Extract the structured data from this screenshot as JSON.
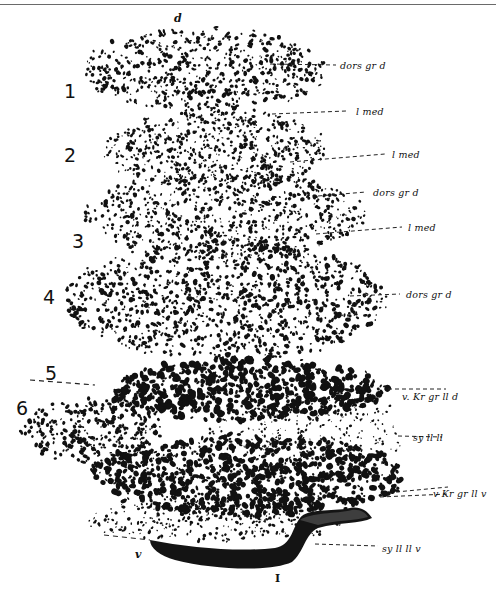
{
  "figure": {
    "ink_color": "#111111",
    "orientation_top": "d",
    "orientation_bottom": "v",
    "roman_numeral": "I",
    "layer_numbers": [
      "1",
      "2",
      "3",
      "4",
      "5",
      "6"
    ],
    "right_labels": [
      "dors gr d",
      "l med",
      "l med",
      "dors gr d",
      "l med",
      "dors gr d",
      "v. Kr gr ll d",
      "sy ll ll",
      "v Kr gr ll v",
      "sy ll ll v"
    ]
  }
}
